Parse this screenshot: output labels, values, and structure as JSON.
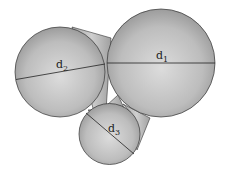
{
  "diagram": {
    "type": "three spheres connected by tangent cylinders",
    "spheres": [
      {
        "id": "sphere-1",
        "label": "d",
        "subscript": "1",
        "cx": 161,
        "cy": 63,
        "r": 54
      },
      {
        "id": "sphere-2",
        "label": "d",
        "subscript": "2",
        "cx": 60,
        "cy": 72,
        "r": 45
      },
      {
        "id": "sphere-3",
        "label": "d",
        "subscript": "3",
        "cx": 109.5,
        "cy": 134,
        "r": 30.5
      }
    ],
    "colors": {
      "fill_light": "#d9d9d9",
      "fill_dark": "#9a9a9a",
      "stroke": "#333333",
      "background": "#ffffff"
    }
  },
  "labels": {
    "d1": "d",
    "d1_sub": "1",
    "d2": "d",
    "d2_sub": "2",
    "d3": "d",
    "d3_sub": "3"
  }
}
